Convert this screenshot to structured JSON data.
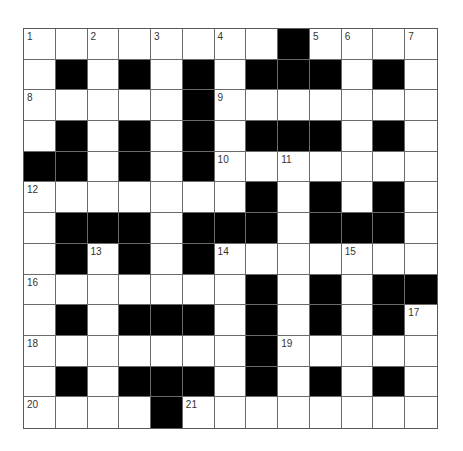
{
  "puzzle": {
    "type": "crossword",
    "rows": 13,
    "cols": 13,
    "colors": {
      "block": "#000000",
      "open": "#ffffff",
      "gridline": "#6a6a6a",
      "number_text": "#333333"
    },
    "layout": [
      "........#....",
      ".#.#.#.###.#.",
      ".....#.......",
      ".#.#.#.###.#.",
      "##.#.#.......",
      ".......#.#.#.",
      ".###.###.###.",
      ".#.#.#.......",
      ".......#.#.##",
      ".#.###.#.#.#.",
      ".......#.....",
      ".#.###.#.#.#.",
      "....#........"
    ],
    "numbers": [
      {
        "row": 0,
        "col": 0,
        "label": "1"
      },
      {
        "row": 0,
        "col": 2,
        "label": "2"
      },
      {
        "row": 0,
        "col": 4,
        "label": "3"
      },
      {
        "row": 0,
        "col": 6,
        "label": "4"
      },
      {
        "row": 0,
        "col": 9,
        "label": "5"
      },
      {
        "row": 0,
        "col": 10,
        "label": "6"
      },
      {
        "row": 0,
        "col": 12,
        "label": "7"
      },
      {
        "row": 2,
        "col": 0,
        "label": "8"
      },
      {
        "row": 2,
        "col": 6,
        "label": "9"
      },
      {
        "row": 4,
        "col": 6,
        "label": "10"
      },
      {
        "row": 4,
        "col": 8,
        "label": "11"
      },
      {
        "row": 5,
        "col": 0,
        "label": "12"
      },
      {
        "row": 7,
        "col": 2,
        "label": "13"
      },
      {
        "row": 7,
        "col": 6,
        "label": "14"
      },
      {
        "row": 7,
        "col": 10,
        "label": "15"
      },
      {
        "row": 8,
        "col": 0,
        "label": "16"
      },
      {
        "row": 9,
        "col": 12,
        "label": "17"
      },
      {
        "row": 10,
        "col": 0,
        "label": "18"
      },
      {
        "row": 10,
        "col": 8,
        "label": "19"
      },
      {
        "row": 12,
        "col": 0,
        "label": "20"
      },
      {
        "row": 12,
        "col": 5,
        "label": "21"
      }
    ]
  }
}
